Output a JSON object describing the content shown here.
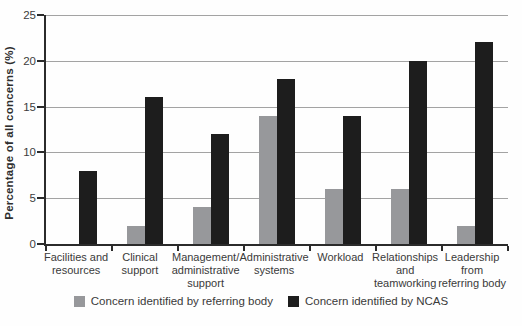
{
  "chart_data": {
    "type": "bar",
    "title": "",
    "xlabel": "",
    "ylabel": "Percentage of all concerns (%)",
    "ylim": [
      0,
      25
    ],
    "yticks": [
      0,
      5,
      10,
      15,
      20,
      25
    ],
    "grid": "horizontal",
    "legend_position": "bottom",
    "categories": [
      "Facilities and resources",
      "Clinical support",
      "Management/administrative support",
      "Administrative systems",
      "Workload",
      "Relationships and teamworking",
      "Leadership from referring body"
    ],
    "category_label_lines": [
      [
        "Facilities and",
        "resources"
      ],
      [
        "Clinical",
        "support"
      ],
      [
        "Management/",
        "administrative",
        "support"
      ],
      [
        "Administrative",
        "systems"
      ],
      [
        "Workload"
      ],
      [
        "Relationships",
        "and",
        "teamworking"
      ],
      [
        "Leadership",
        "from",
        "referring body"
      ]
    ],
    "series": [
      {
        "name": "Concern identified by referring body",
        "slug": "referring-body",
        "color": "#97989b",
        "values": [
          0,
          2,
          4,
          14,
          6,
          6,
          2
        ]
      },
      {
        "name": "Concern identified by NCAS",
        "slug": "ncas",
        "color": "#1d1d1d",
        "values": [
          8,
          16,
          12,
          18,
          14,
          20,
          22
        ]
      }
    ]
  },
  "colors": {
    "grid_line": "#a3a3a3",
    "axis_line": "#2b2b2b",
    "text": "#3a3a3a",
    "background": "#fefefe"
  }
}
